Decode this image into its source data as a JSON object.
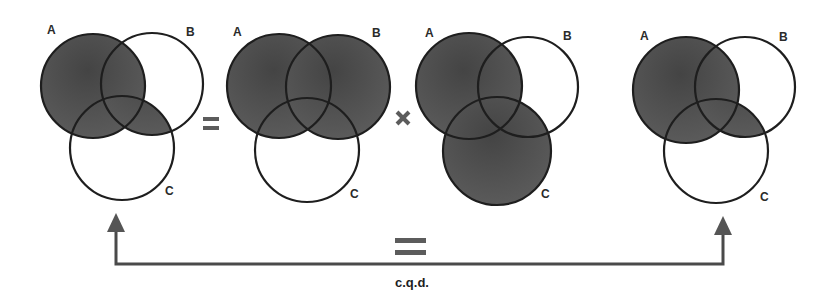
{
  "figure": {
    "colors": {
      "background": "#ffffff",
      "outline": "#1e1e1e",
      "shade_dark": "#444444",
      "shade_light": "#606060",
      "operator": "#5c5c5c",
      "connector": "#4a4a4a"
    },
    "diagrams": [
      {
        "id": "lhs",
        "expression": "A ∪ (B ∩ C)",
        "shaded": [
          [
            "A"
          ],
          [
            "B",
            "C"
          ]
        ],
        "circles": {
          "A": {
            "cx": 93,
            "cy": 86,
            "r": 52
          },
          "B": {
            "cx": 152,
            "cy": 84,
            "r": 51
          },
          "C": {
            "cx": 122,
            "cy": 148,
            "r": 52
          }
        },
        "labels": [
          {
            "text": "A",
            "x": 47,
            "y": 34
          },
          {
            "text": "B",
            "x": 186,
            "y": 36
          },
          {
            "text": "C",
            "x": 165,
            "y": 195
          }
        ]
      },
      {
        "id": "factor1",
        "expression": "A ∪ B",
        "shaded": [
          [
            "A"
          ],
          [
            "B"
          ]
        ],
        "circles": {
          "A": {
            "cx": 279,
            "cy": 86,
            "r": 52
          },
          "B": {
            "cx": 338,
            "cy": 87,
            "r": 52
          },
          "C": {
            "cx": 307,
            "cy": 150,
            "r": 52
          }
        },
        "labels": [
          {
            "text": "A",
            "x": 233,
            "y": 36
          },
          {
            "text": "B",
            "x": 372,
            "y": 37
          },
          {
            "text": "C",
            "x": 350,
            "y": 198
          }
        ]
      },
      {
        "id": "factor2",
        "expression": "A ∪ C",
        "shaded": [
          [
            "A"
          ],
          [
            "C"
          ]
        ],
        "circles": {
          "A": {
            "cx": 469,
            "cy": 86,
            "r": 53
          },
          "B": {
            "cx": 528,
            "cy": 87,
            "r": 50
          },
          "C": {
            "cx": 497,
            "cy": 151,
            "r": 54
          }
        },
        "labels": [
          {
            "text": "A",
            "x": 425,
            "y": 37
          },
          {
            "text": "B",
            "x": 563,
            "y": 40
          },
          {
            "text": "C",
            "x": 541,
            "y": 198
          }
        ]
      },
      {
        "id": "rhs",
        "expression": "A ∪ (B ∩ C)",
        "shaded": [
          [
            "A"
          ],
          [
            "B",
            "C"
          ]
        ],
        "circles": {
          "A": {
            "cx": 686,
            "cy": 90,
            "r": 53
          },
          "B": {
            "cx": 745,
            "cy": 87,
            "r": 50
          },
          "C": {
            "cx": 716,
            "cy": 151,
            "r": 52
          }
        },
        "labels": [
          {
            "text": "A",
            "x": 640,
            "y": 40
          },
          {
            "text": "B",
            "x": 779,
            "y": 41
          },
          {
            "text": "C",
            "x": 760,
            "y": 201
          }
        ]
      }
    ],
    "operators": [
      {
        "type": "equals",
        "symbol": "=",
        "x": 203,
        "y": 117,
        "width": 16
      },
      {
        "type": "times",
        "symbol": "×",
        "x": 397,
        "y": 112,
        "size": 12
      }
    ],
    "connector": {
      "left_x": 116,
      "right_x": 723,
      "line_y": 264,
      "left_tip_y": 213,
      "right_tip_y": 216,
      "head_half_width": 9,
      "head_height": 19
    },
    "bottom_equals": {
      "symbol": "=",
      "x": 395,
      "y": 238,
      "width": 31
    },
    "conclusion": {
      "text": "c.q.d.",
      "x": 412,
      "y": 287
    }
  }
}
